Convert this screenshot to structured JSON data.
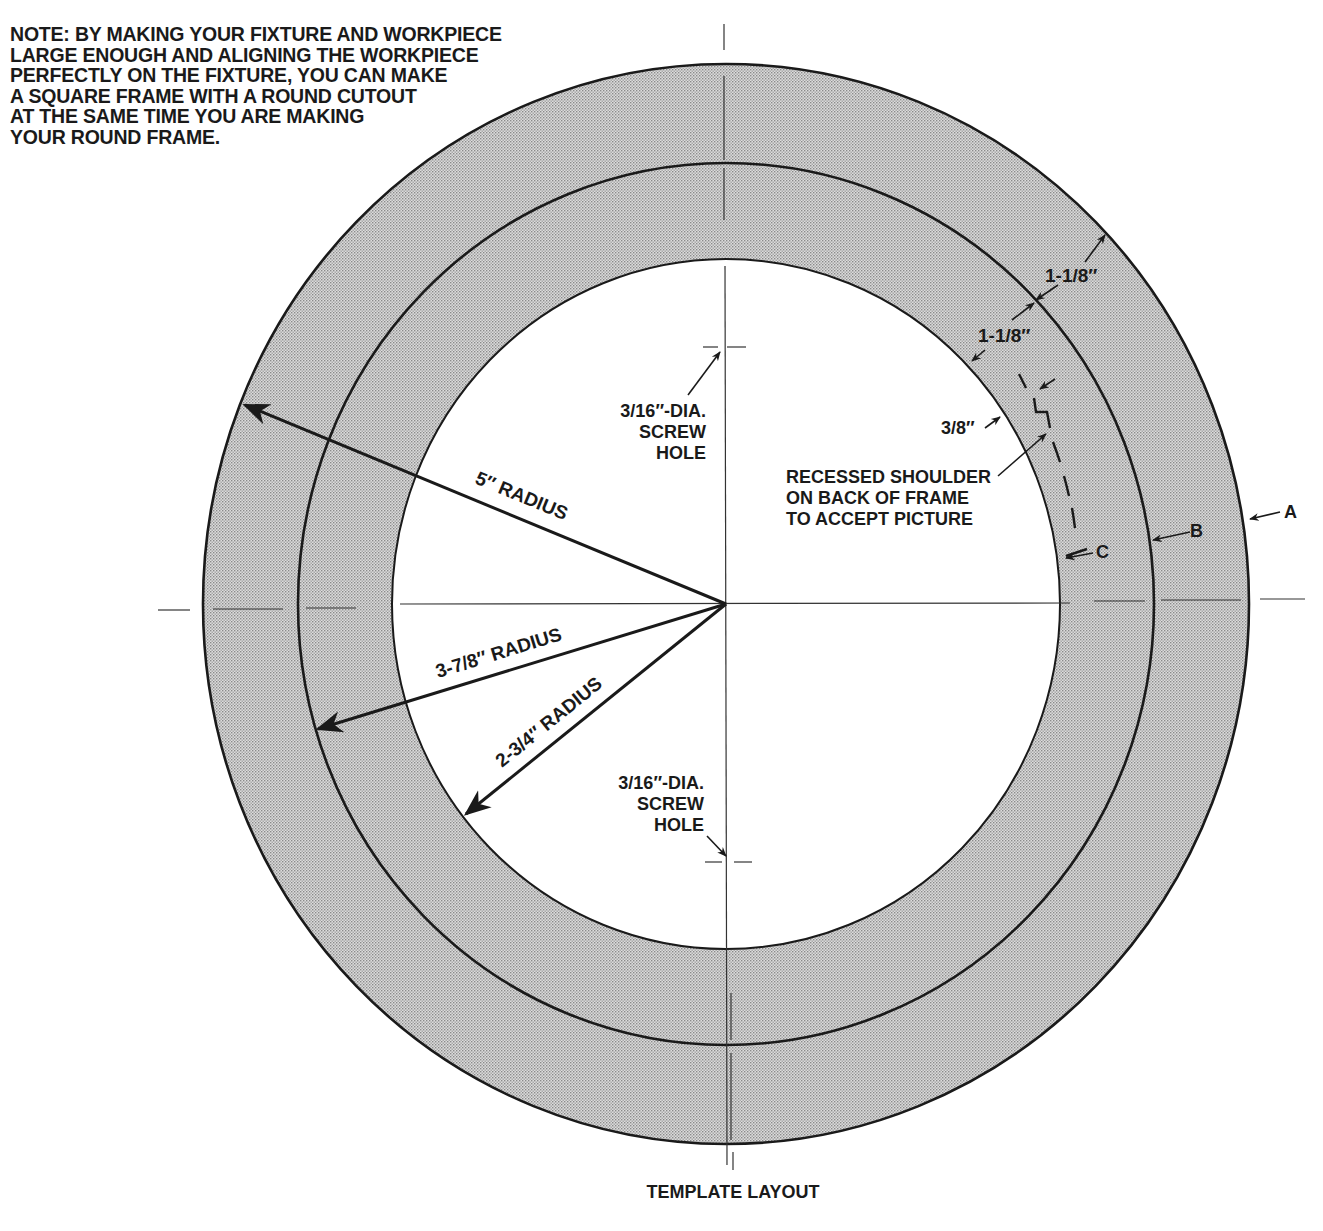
{
  "note": {
    "lines": [
      "NOTE:  BY MAKING YOUR FIXTURE AND WORKPIECE",
      "LARGE ENOUGH AND ALIGNING THE WORKPIECE",
      "PERFECTLY ON THE FIXTURE, YOU CAN MAKE",
      "A SQUARE FRAME WITH A ROUND CUTOUT",
      "AT THE SAME TIME YOU ARE MAKING",
      "YOUR ROUND FRAME."
    ]
  },
  "dimensions": {
    "outer_radius": "5″ RADIUS",
    "middle_radius": "3-7/8″ RADIUS",
    "inner_radius": "2-3/4″ RADIUS",
    "band_outer_width": "1-1/8″",
    "band_inner_width": "1-1/8″",
    "shoulder_width": "3/8″"
  },
  "screw_hole_top": {
    "line1": "3/16″-DIA.",
    "line2": "SCREW",
    "line3": "HOLE"
  },
  "screw_hole_bottom": {
    "line1": "3/16″-DIA.",
    "line2": "SCREW",
    "line3": "HOLE"
  },
  "recessed_shoulder": {
    "line1": "RECESSED SHOULDER",
    "line2": "ON BACK OF FRAME",
    "line3": "TO ACCEPT PICTURE"
  },
  "circle_labels": {
    "outer": "A",
    "middle": "B",
    "inner": "C"
  },
  "caption": "TEMPLATE LAYOUT",
  "colors": {
    "ink": "#1a1a1a",
    "stipple": "#c8c8c8",
    "background": "#ffffff"
  }
}
